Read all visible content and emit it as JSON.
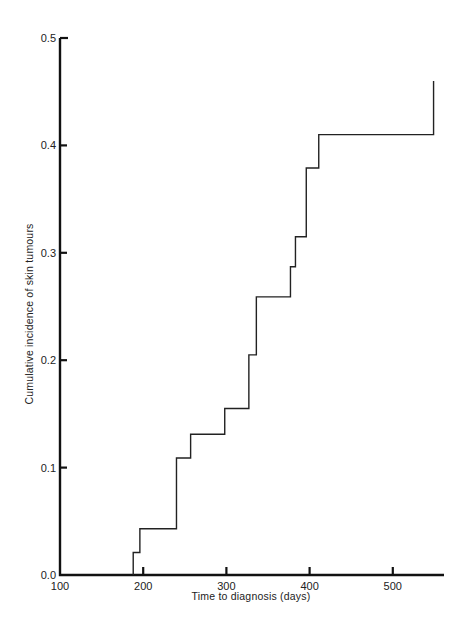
{
  "chart_data": {
    "type": "line",
    "subtype": "step",
    "title": "",
    "xlabel": "Time to diagnosis (days)",
    "ylabel": "Cumulative incidence of skin tumours",
    "xlim": [
      100,
      560
    ],
    "ylim": [
      0.0,
      0.5
    ],
    "xticks": [
      100,
      200,
      300,
      400,
      500
    ],
    "xtick_labels": [
      "100",
      "200",
      "300",
      "400",
      "500"
    ],
    "yticks": [
      0.0,
      0.1,
      0.2,
      0.3,
      0.4,
      0.5
    ],
    "ytick_labels": [
      "0.0",
      "0.1",
      "0.2",
      "0.3",
      "0.4",
      "0.5"
    ],
    "grid": false,
    "legend": null,
    "series": [
      {
        "name": "Cumulative incidence",
        "x": [
          188,
          196,
          240,
          257,
          298,
          327,
          336,
          377,
          383,
          396,
          411,
          549
        ],
        "y": [
          0.021,
          0.043,
          0.109,
          0.131,
          0.155,
          0.205,
          0.259,
          0.287,
          0.315,
          0.379,
          0.41,
          0.46
        ]
      }
    ]
  }
}
